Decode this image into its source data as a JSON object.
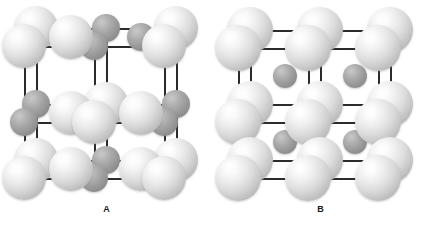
{
  "figure": {
    "background_color": "#ffffff",
    "bond_color": "#2b2b2b",
    "large_ion_color": "#dcdcdc",
    "small_ion_color": "#9b9b9b",
    "edge_credit_text": ""
  },
  "panels": [
    {
      "id": "panel-a",
      "label": "A",
      "structure_name": "rock-salt cubic lattice",
      "large_atom_count": 14,
      "small_atom_count": 13
    },
    {
      "id": "panel-b",
      "label": "B",
      "structure_name": "cubic lattice with interstitial ions",
      "large_atom_count": 14,
      "small_atom_count": 4
    }
  ],
  "lattice_a": {
    "bonds_h": [
      {
        "x": 36,
        "y": 28,
        "w": 140
      },
      {
        "x": 36,
        "y": 46,
        "w": 140
      },
      {
        "x": 24,
        "y": 104,
        "w": 140
      },
      {
        "x": 24,
        "y": 122,
        "w": 140
      },
      {
        "x": 36,
        "y": 160,
        "w": 140
      },
      {
        "x": 36,
        "y": 178,
        "w": 140
      }
    ],
    "bonds_v": [
      {
        "x": 36,
        "y": 28,
        "h": 132
      },
      {
        "x": 106,
        "y": 28,
        "h": 132
      },
      {
        "x": 176,
        "y": 28,
        "h": 132
      },
      {
        "x": 24,
        "y": 46,
        "h": 132
      },
      {
        "x": 94,
        "y": 46,
        "h": 132
      },
      {
        "x": 164,
        "y": 46,
        "h": 132
      }
    ],
    "atoms": [
      {
        "cx": 36,
        "cy": 28,
        "r": 22,
        "type": "light"
      },
      {
        "cx": 106,
        "cy": 28,
        "r": 14,
        "type": "dark"
      },
      {
        "cx": 176,
        "cy": 28,
        "r": 22,
        "type": "light"
      },
      {
        "cx": 24,
        "cy": 46,
        "r": 22,
        "type": "light"
      },
      {
        "cx": 94,
        "cy": 46,
        "r": 14,
        "type": "dark"
      },
      {
        "cx": 164,
        "cy": 46,
        "r": 22,
        "type": "light"
      },
      {
        "cx": 71,
        "cy": 37,
        "r": 22,
        "type": "light"
      },
      {
        "cx": 141,
        "cy": 37,
        "r": 14,
        "type": "dark"
      },
      {
        "cx": 36,
        "cy": 104,
        "r": 14,
        "type": "dark"
      },
      {
        "cx": 106,
        "cy": 104,
        "r": 22,
        "type": "light"
      },
      {
        "cx": 176,
        "cy": 104,
        "r": 14,
        "type": "dark"
      },
      {
        "cx": 24,
        "cy": 122,
        "r": 14,
        "type": "dark"
      },
      {
        "cx": 94,
        "cy": 122,
        "r": 22,
        "type": "light"
      },
      {
        "cx": 164,
        "cy": 122,
        "r": 14,
        "type": "dark"
      },
      {
        "cx": 71,
        "cy": 113,
        "r": 22,
        "type": "light"
      },
      {
        "cx": 141,
        "cy": 113,
        "r": 22,
        "type": "light"
      },
      {
        "cx": 36,
        "cy": 160,
        "r": 22,
        "type": "light"
      },
      {
        "cx": 106,
        "cy": 160,
        "r": 14,
        "type": "dark"
      },
      {
        "cx": 176,
        "cy": 160,
        "r": 22,
        "type": "light"
      },
      {
        "cx": 24,
        "cy": 178,
        "r": 22,
        "type": "light"
      },
      {
        "cx": 94,
        "cy": 178,
        "r": 14,
        "type": "dark"
      },
      {
        "cx": 164,
        "cy": 178,
        "r": 22,
        "type": "light"
      },
      {
        "cx": 71,
        "cy": 169,
        "r": 22,
        "type": "light"
      },
      {
        "cx": 141,
        "cy": 169,
        "r": 22,
        "type": "light"
      }
    ]
  },
  "lattice_b": {
    "bonds_h": [
      {
        "x": 36,
        "y": 30,
        "w": 140
      },
      {
        "x": 24,
        "y": 48,
        "w": 140
      },
      {
        "x": 36,
        "y": 104,
        "w": 140
      },
      {
        "x": 24,
        "y": 122,
        "w": 140
      },
      {
        "x": 36,
        "y": 160,
        "w": 140
      },
      {
        "x": 24,
        "y": 178,
        "w": 140
      }
    ],
    "bonds_v": [
      {
        "x": 36,
        "y": 30,
        "h": 130
      },
      {
        "x": 106,
        "y": 30,
        "h": 130
      },
      {
        "x": 176,
        "y": 30,
        "h": 130
      },
      {
        "x": 24,
        "y": 48,
        "h": 130
      },
      {
        "x": 94,
        "y": 48,
        "h": 130
      },
      {
        "x": 164,
        "y": 48,
        "h": 130
      }
    ],
    "atoms": [
      {
        "cx": 36,
        "cy": 30,
        "r": 23,
        "type": "light"
      },
      {
        "cx": 106,
        "cy": 30,
        "r": 23,
        "type": "light"
      },
      {
        "cx": 176,
        "cy": 30,
        "r": 23,
        "type": "light"
      },
      {
        "cx": 24,
        "cy": 48,
        "r": 23,
        "type": "light"
      },
      {
        "cx": 94,
        "cy": 48,
        "r": 23,
        "type": "light"
      },
      {
        "cx": 164,
        "cy": 48,
        "r": 23,
        "type": "light"
      },
      {
        "cx": 36,
        "cy": 104,
        "r": 23,
        "type": "light"
      },
      {
        "cx": 106,
        "cy": 104,
        "r": 23,
        "type": "light"
      },
      {
        "cx": 176,
        "cy": 104,
        "r": 23,
        "type": "light"
      },
      {
        "cx": 24,
        "cy": 122,
        "r": 23,
        "type": "light"
      },
      {
        "cx": 94,
        "cy": 122,
        "r": 23,
        "type": "light"
      },
      {
        "cx": 164,
        "cy": 122,
        "r": 23,
        "type": "light"
      },
      {
        "cx": 36,
        "cy": 160,
        "r": 23,
        "type": "light"
      },
      {
        "cx": 106,
        "cy": 160,
        "r": 23,
        "type": "light"
      },
      {
        "cx": 176,
        "cy": 160,
        "r": 23,
        "type": "light"
      },
      {
        "cx": 24,
        "cy": 178,
        "r": 23,
        "type": "light"
      },
      {
        "cx": 94,
        "cy": 178,
        "r": 23,
        "type": "light"
      },
      {
        "cx": 164,
        "cy": 178,
        "r": 23,
        "type": "light"
      },
      {
        "cx": 71,
        "cy": 76,
        "r": 12,
        "type": "dark"
      },
      {
        "cx": 141,
        "cy": 76,
        "r": 12,
        "type": "dark"
      },
      {
        "cx": 71,
        "cy": 142,
        "r": 12,
        "type": "dark"
      },
      {
        "cx": 141,
        "cy": 142,
        "r": 12,
        "type": "dark"
      }
    ]
  }
}
